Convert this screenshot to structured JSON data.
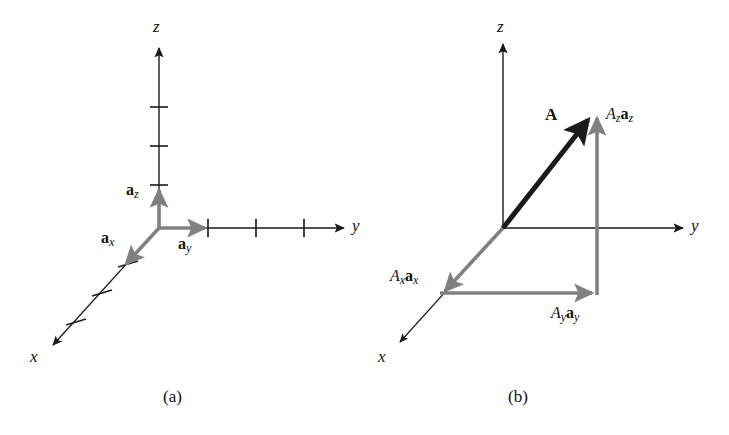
{
  "figure": {
    "background_color": "#ffffff",
    "black_color": "#1a1a1a",
    "gray_color": "#808080"
  },
  "panels": [
    {
      "id": "a",
      "caption": "(a)",
      "axes": [
        {
          "name": "z-axis",
          "label": "z",
          "ticks": 3
        },
        {
          "name": "y-axis",
          "label": "y",
          "ticks": 3
        },
        {
          "name": "x-axis",
          "label": "x",
          "ticks": 3
        }
      ],
      "vectors": [
        {
          "name": "unit-vector-z",
          "symbol": "a",
          "subscript": "z",
          "color": "#808080"
        },
        {
          "name": "unit-vector-y",
          "symbol": "a",
          "subscript": "y",
          "color": "#808080"
        },
        {
          "name": "unit-vector-x",
          "symbol": "a",
          "subscript": "x",
          "color": "#808080"
        }
      ]
    },
    {
      "id": "b",
      "caption": "(b)",
      "axes": [
        {
          "name": "z-axis",
          "label": "z",
          "ticks": 0
        },
        {
          "name": "y-axis",
          "label": "y",
          "ticks": 0
        },
        {
          "name": "x-axis",
          "label": "x",
          "ticks": 0
        }
      ],
      "vectors": [
        {
          "name": "vector-A",
          "magnitude_symbol": "A",
          "color": "#1a1a1a"
        },
        {
          "name": "component-z",
          "scalar": "A",
          "scalar_sub": "z",
          "symbol": "a",
          "subscript": "z",
          "color": "#808080"
        },
        {
          "name": "component-y",
          "scalar": "A",
          "scalar_sub": "y",
          "symbol": "a",
          "subscript": "y",
          "color": "#808080"
        },
        {
          "name": "component-x",
          "scalar": "A",
          "scalar_sub": "x",
          "symbol": "a",
          "subscript": "x",
          "color": "#808080"
        }
      ]
    }
  ],
  "labels": {
    "a_axis_z": "z",
    "a_axis_y": "y",
    "a_axis_x": "x",
    "a_unit_z_sym": "a",
    "a_unit_z_sub": "z",
    "a_unit_y_sym": "a",
    "a_unit_y_sub": "y",
    "a_unit_x_sym": "a",
    "a_unit_x_sub": "x",
    "a_caption": "(a)",
    "b_axis_z": "z",
    "b_axis_y": "y",
    "b_axis_x": "x",
    "b_vector_A": "A",
    "b_comp_z_scalar": "A",
    "b_comp_z_scalar_sub": "z",
    "b_comp_z_sym": "a",
    "b_comp_z_sub": "z",
    "b_comp_y_scalar": "A",
    "b_comp_y_scalar_sub": "y",
    "b_comp_y_sym": "a",
    "b_comp_y_sub": "y",
    "b_comp_x_scalar": "A",
    "b_comp_x_scalar_sub": "x",
    "b_comp_x_sym": "a",
    "b_comp_x_sub": "x",
    "b_caption": "(b)"
  }
}
